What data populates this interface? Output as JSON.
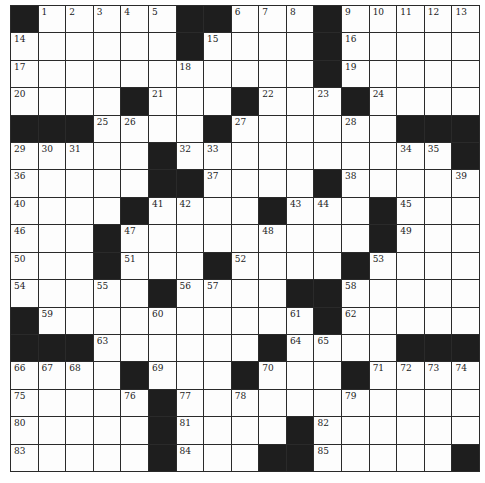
{
  "puzzle": {
    "rows": 17,
    "cols": 17,
    "colors": {
      "block": "#1e1e1e",
      "cell": "#fdfdfd",
      "line": "#2a2a2a"
    },
    "grid": [
      [
        "#",
        "1",
        "2",
        "3",
        "4",
        "5",
        "#",
        "#",
        "6",
        "7",
        "8",
        "#",
        "9",
        "10",
        "11",
        "12",
        "13"
      ],
      [
        "14",
        "",
        "",
        "",
        "",
        "",
        "#",
        "15",
        "",
        "",
        "",
        "#",
        "16",
        "",
        "",
        "",
        ""
      ],
      [
        "17",
        "",
        "",
        "",
        "",
        "",
        "18",
        "",
        "",
        "",
        "",
        "#",
        "19",
        "",
        "",
        "",
        ""
      ],
      [
        "20",
        "",
        "",
        "",
        "#",
        "21",
        "",
        "",
        "#",
        "22",
        "",
        "23",
        "#",
        "24",
        "",
        "",
        ""
      ],
      [
        "#",
        "#",
        "#",
        "25",
        "26",
        "",
        "",
        "#",
        "27",
        "",
        "",
        "",
        "28",
        "",
        "#",
        "#",
        "#"
      ],
      [
        "29",
        "30",
        "31",
        "",
        "",
        "#",
        "32",
        "33",
        "",
        "",
        "",
        "",
        "",
        "",
        "34",
        "35",
        "#"
      ],
      [
        "36",
        "",
        "",
        "",
        "",
        "#",
        "#",
        "37",
        "",
        "",
        "",
        "#",
        "38",
        "",
        "",
        "",
        "39"
      ],
      [
        "40",
        "",
        "",
        "",
        "#",
        "41",
        "42",
        "",
        "",
        "#",
        "43",
        "44",
        "",
        "#",
        "45",
        "",
        ""
      ],
      [
        "46",
        "",
        "",
        "#",
        "47",
        "",
        "",
        "",
        "",
        "48",
        "",
        "",
        "",
        "#",
        "49",
        "",
        ""
      ],
      [
        "50",
        "",
        "",
        "#",
        "51",
        "",
        "",
        "#",
        "52",
        "",
        "",
        "",
        "#",
        "53",
        "",
        "",
        ""
      ],
      [
        "54",
        "",
        "",
        "55",
        "",
        "#",
        "56",
        "57",
        "",
        "",
        "#",
        "#",
        "58",
        "",
        "",
        "",
        ""
      ],
      [
        "#",
        "59",
        "",
        "",
        "",
        "60",
        "",
        "",
        "",
        "",
        "61",
        "#",
        "62",
        "",
        "",
        "",
        ""
      ],
      [
        "#",
        "#",
        "#",
        "63",
        "",
        "",
        "",
        "",
        "",
        "#",
        "64",
        "65",
        "",
        "",
        "#",
        "#",
        "#"
      ],
      [
        "66",
        "67",
        "68",
        "",
        "#",
        "69",
        "",
        "",
        "#",
        "70",
        "",
        "",
        "#",
        "71",
        "72",
        "73",
        "74"
      ],
      [
        "75",
        "",
        "",
        "",
        "76",
        "#",
        "77",
        "",
        "78",
        "",
        "",
        "",
        "79",
        "",
        "",
        "",
        ""
      ],
      [
        "80",
        "",
        "",
        "",
        "",
        "#",
        "81",
        "",
        "",
        "",
        "#",
        "82",
        "",
        "",
        "",
        "",
        ""
      ],
      [
        "83",
        "",
        "",
        "",
        "",
        "#",
        "84",
        "",
        "",
        "#",
        "#",
        "85",
        "",
        "",
        "",
        "",
        "#"
      ]
    ]
  }
}
